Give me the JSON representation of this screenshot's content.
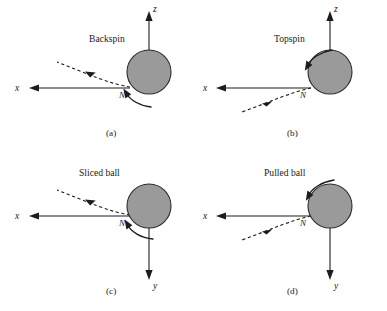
{
  "figure": {
    "background_color": "#ffffff",
    "ball_fill_color": "#9a9a9a",
    "ball_stroke_color": "#2a2a2a",
    "line_color": "#1c1c1c",
    "panels": [
      {
        "id": "a",
        "tag": "(a)",
        "title": "Backspin",
        "node_label": "N",
        "vertical_axis_label": "z",
        "horizontal_axis_label": "x",
        "vertical_axis_direction": "up",
        "trajectory_direction": "up-left",
        "spin_arc_position": "bottom-left",
        "spin_sense": "counterclockwise"
      },
      {
        "id": "b",
        "tag": "(b)",
        "title": "Topspin",
        "node_label": "N",
        "vertical_axis_label": "z",
        "horizontal_axis_label": "x",
        "vertical_axis_direction": "up",
        "trajectory_direction": "down-left",
        "spin_arc_position": "top-left",
        "spin_sense": "clockwise"
      },
      {
        "id": "c",
        "tag": "(c)",
        "title": "Sliced ball",
        "node_label": "N",
        "vertical_axis_label": "y",
        "horizontal_axis_label": "x",
        "vertical_axis_direction": "down",
        "trajectory_direction": "up-left",
        "spin_arc_position": "bottom-left",
        "spin_sense": "counterclockwise"
      },
      {
        "id": "d",
        "tag": "(d)",
        "title": "Pulled ball",
        "node_label": "N",
        "vertical_axis_label": "y",
        "horizontal_axis_label": "x",
        "vertical_axis_direction": "down",
        "trajectory_direction": "down-left",
        "spin_arc_position": "top-left",
        "spin_sense": "clockwise"
      }
    ]
  }
}
